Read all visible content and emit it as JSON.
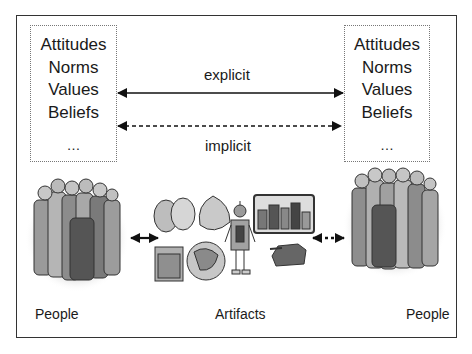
{
  "diagram": {
    "left_values_box": {
      "lines": [
        "Attitudes",
        "Norms",
        "Values",
        "Beliefs",
        "…"
      ]
    },
    "right_values_box": {
      "lines": [
        "Attitudes",
        "Norms",
        "Values",
        "Beliefs",
        "…"
      ]
    },
    "arrows": {
      "explicit_label": "explicit",
      "implicit_label": "implicit"
    },
    "bottom_labels": {
      "left_people": "People",
      "artifacts": "Artifacts",
      "right_people": "People"
    },
    "illustrations": {
      "left_group": "people-group-clipart",
      "right_group": "people-group-clipart",
      "artifacts": [
        "theater-masks",
        "bird-figure",
        "framed-picture",
        "globe",
        "robot",
        "city-skyline",
        "tank"
      ]
    }
  }
}
